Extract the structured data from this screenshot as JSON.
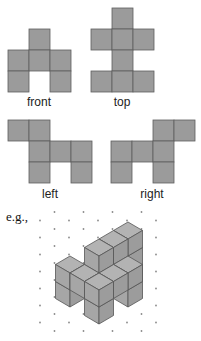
{
  "views": {
    "cell_size": 21,
    "fill": "#9b9b9b",
    "stroke": "#5e5e5e",
    "items": [
      {
        "id": "front",
        "label": "front",
        "label_x": 39,
        "label_y": 96,
        "origin": [
          8,
          29
        ],
        "cells": [
          [
            1,
            0
          ],
          [
            0,
            1
          ],
          [
            1,
            1
          ],
          [
            2,
            1
          ],
          [
            0,
            2
          ],
          [
            2,
            2
          ]
        ]
      },
      {
        "id": "top",
        "label": "top",
        "label_x": 122,
        "label_y": 96,
        "origin": [
          91,
          8
        ],
        "cells": [
          [
            1,
            0
          ],
          [
            0,
            1
          ],
          [
            1,
            1
          ],
          [
            2,
            1
          ],
          [
            1,
            2
          ],
          [
            0,
            3
          ],
          [
            1,
            3
          ],
          [
            2,
            3
          ]
        ]
      },
      {
        "id": "left",
        "label": "left",
        "label_x": 50,
        "label_y": 188,
        "origin": [
          8,
          120
        ],
        "cells": [
          [
            0,
            0
          ],
          [
            1,
            0
          ],
          [
            1,
            1
          ],
          [
            2,
            1
          ],
          [
            3,
            1
          ],
          [
            1,
            2
          ],
          [
            3,
            2
          ]
        ]
      },
      {
        "id": "right",
        "label": "right",
        "label_x": 152,
        "label_y": 188,
        "origin": [
          111,
          120
        ],
        "cells": [
          [
            2,
            0
          ],
          [
            3,
            0
          ],
          [
            0,
            1
          ],
          [
            1,
            1
          ],
          [
            2,
            1
          ],
          [
            0,
            2
          ],
          [
            2,
            2
          ]
        ]
      }
    ]
  },
  "example": {
    "label": "e.g.,",
    "iso": {
      "ox": 99,
      "oy": 256,
      "hw": 14.5,
      "hh": 8.5,
      "vz": 17
    },
    "face_colors": {
      "top": "#b3b3b3",
      "left": "#a6a6a6",
      "right": "#9c9c9c",
      "edge": "#555555"
    },
    "dot_color": "#8a8a8a",
    "dots": {
      "x0": 40,
      "y0": 212,
      "dx": 29,
      "dy": 8.5,
      "cols": 5,
      "rows": 15
    },
    "cubes": [
      [
        2,
        0,
        0
      ],
      [
        2,
        0,
        1
      ],
      [
        2,
        0,
        2
      ],
      [
        2,
        1,
        2
      ],
      [
        2,
        2,
        2
      ],
      [
        3,
        1,
        0
      ],
      [
        3,
        1,
        1
      ],
      [
        2,
        2,
        1
      ],
      [
        1,
        3,
        0
      ],
      [
        1,
        3,
        1
      ],
      [
        2,
        3,
        1
      ],
      [
        3,
        2,
        1
      ],
      [
        3,
        3,
        0
      ],
      [
        3,
        3,
        1
      ]
    ]
  }
}
